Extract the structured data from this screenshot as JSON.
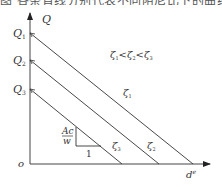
{
  "clipped_header_text": "图 各条直线分别代表不同阻尼比下的曲线",
  "diagram": {
    "y_axis": {
      "label": "Q"
    },
    "x_axis": {
      "label": "d",
      "label_sup": "e"
    },
    "origin": {
      "label": "o"
    },
    "y_ticks": [
      {
        "label": "Q",
        "sub": "1"
      },
      {
        "label": "Q",
        "sub": "2"
      },
      {
        "label": "Q",
        "sub": "3"
      }
    ],
    "lines": [
      {
        "label": "ζ",
        "sub": "1",
        "start": "Q1"
      },
      {
        "label": "ζ",
        "sub": "2",
        "start": "Q2"
      },
      {
        "label": "ζ",
        "sub": "3",
        "start": "Q3"
      }
    ],
    "relation": {
      "z": "ζ",
      "s1": "1",
      "s2": "2",
      "s3": "3",
      "lt": "<"
    },
    "slope_triangle": {
      "rise_num": "Ac",
      "rise_den": "w",
      "run": "1"
    }
  }
}
